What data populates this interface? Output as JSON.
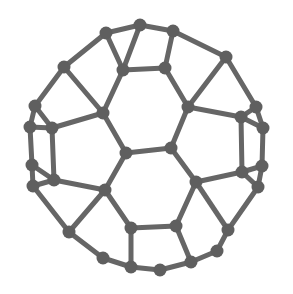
{
  "figure": {
    "kind": "molecular-structure-diagram",
    "molecule_name": "Fullerene (buckminsterfullerene)",
    "representation": "ball-and-stick graph",
    "background_color": "#ffffff",
    "bond_color": "#666666",
    "atom_color": "#5f5f5f",
    "bond_width": 5,
    "atom_radius": 6.5,
    "canvas": {
      "width": 293,
      "height": 294
    },
    "atom_count": 44,
    "bond_count": 66
  },
  "graph": {
    "atoms": [
      {
        "id": 0,
        "x": 140,
        "y": 25
      },
      {
        "id": 1,
        "x": 106,
        "y": 33
      },
      {
        "id": 2,
        "x": 173,
        "y": 31
      },
      {
        "id": 3,
        "x": 123,
        "y": 70
      },
      {
        "id": 4,
        "x": 165,
        "y": 68
      },
      {
        "id": 5,
        "x": 64,
        "y": 67
      },
      {
        "id": 6,
        "x": 226,
        "y": 57
      },
      {
        "id": 7,
        "x": 35,
        "y": 106
      },
      {
        "id": 8,
        "x": 30,
        "y": 127
      },
      {
        "id": 9,
        "x": 103,
        "y": 113
      },
      {
        "id": 10,
        "x": 188,
        "y": 107
      },
      {
        "id": 11,
        "x": 256,
        "y": 107
      },
      {
        "id": 12,
        "x": 263,
        "y": 128
      },
      {
        "id": 13,
        "x": 52,
        "y": 128
      },
      {
        "id": 14,
        "x": 241,
        "y": 117
      },
      {
        "id": 15,
        "x": 126,
        "y": 153
      },
      {
        "id": 16,
        "x": 171,
        "y": 148
      },
      {
        "id": 17,
        "x": 32,
        "y": 165
      },
      {
        "id": 18,
        "x": 33,
        "y": 186
      },
      {
        "id": 19,
        "x": 262,
        "y": 166
      },
      {
        "id": 20,
        "x": 258,
        "y": 187
      },
      {
        "id": 21,
        "x": 54,
        "y": 180
      },
      {
        "id": 22,
        "x": 242,
        "y": 172
      },
      {
        "id": 23,
        "x": 105,
        "y": 190
      },
      {
        "id": 24,
        "x": 196,
        "y": 182
      },
      {
        "id": 25,
        "x": 69,
        "y": 232
      },
      {
        "id": 26,
        "x": 228,
        "y": 230
      },
      {
        "id": 27,
        "x": 131,
        "y": 228
      },
      {
        "id": 28,
        "x": 176,
        "y": 226
      },
      {
        "id": 29,
        "x": 131,
        "y": 267
      },
      {
        "id": 30,
        "x": 160,
        "y": 270
      },
      {
        "id": 31,
        "x": 191,
        "y": 262
      },
      {
        "id": 32,
        "x": 103,
        "y": 258
      },
      {
        "id": 33,
        "x": 217,
        "y": 251
      }
    ],
    "bonds": [
      [
        0,
        1
      ],
      [
        0,
        2
      ],
      [
        0,
        3
      ],
      [
        1,
        5
      ],
      [
        1,
        3
      ],
      [
        2,
        6
      ],
      [
        2,
        4
      ],
      [
        3,
        4
      ],
      [
        3,
        9
      ],
      [
        4,
        10
      ],
      [
        5,
        7
      ],
      [
        5,
        9
      ],
      [
        6,
        11
      ],
      [
        6,
        10
      ],
      [
        7,
        8
      ],
      [
        7,
        13
      ],
      [
        8,
        13
      ],
      [
        8,
        17
      ],
      [
        9,
        13
      ],
      [
        9,
        15
      ],
      [
        10,
        14
      ],
      [
        10,
        16
      ],
      [
        11,
        12
      ],
      [
        11,
        14
      ],
      [
        12,
        14
      ],
      [
        12,
        19
      ],
      [
        13,
        21
      ],
      [
        14,
        22
      ],
      [
        15,
        16
      ],
      [
        15,
        23
      ],
      [
        16,
        24
      ],
      [
        17,
        18
      ],
      [
        17,
        21
      ],
      [
        18,
        21
      ],
      [
        18,
        25
      ],
      [
        19,
        20
      ],
      [
        19,
        22
      ],
      [
        20,
        22
      ],
      [
        20,
        26
      ],
      [
        21,
        23
      ],
      [
        22,
        24
      ],
      [
        23,
        27
      ],
      [
        23,
        25
      ],
      [
        24,
        28
      ],
      [
        24,
        26
      ],
      [
        25,
        32
      ],
      [
        26,
        33
      ],
      [
        27,
        28
      ],
      [
        27,
        29
      ],
      [
        28,
        31
      ],
      [
        29,
        30
      ],
      [
        29,
        32
      ],
      [
        30,
        31
      ],
      [
        31,
        33
      ]
    ]
  }
}
